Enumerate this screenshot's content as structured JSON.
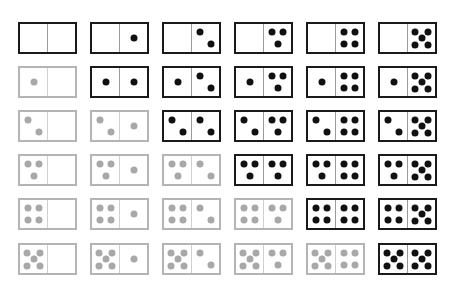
{
  "diagram": {
    "title": "",
    "layout": {
      "columns": 6,
      "rows": 6,
      "col_left": [
        18,
        90,
        162,
        234,
        306,
        378
      ],
      "row_top": [
        22,
        66,
        110,
        154,
        198,
        243
      ],
      "domino_width": 59,
      "domino_height": 32
    },
    "colors": {
      "active_border": "#1a1a1a",
      "active_pip": "#111111",
      "inactive_border": "#b4b4b4",
      "inactive_pip": "#a8a8a8",
      "background": "#ffffff"
    },
    "rows": [
      {
        "dominoes": [
          {
            "left": 0,
            "right": 0,
            "style": "black"
          },
          {
            "left": 0,
            "right": 1,
            "style": "black"
          },
          {
            "left": 0,
            "right": 2,
            "style": "black"
          },
          {
            "left": 0,
            "right": 3,
            "style": "black"
          },
          {
            "left": 0,
            "right": 4,
            "style": "black"
          },
          {
            "left": 0,
            "right": 5,
            "style": "black"
          }
        ]
      },
      {
        "dominoes": [
          {
            "left": 1,
            "right": 0,
            "style": "gray"
          },
          {
            "left": 1,
            "right": 1,
            "style": "black"
          },
          {
            "left": 1,
            "right": 2,
            "style": "black"
          },
          {
            "left": 1,
            "right": 3,
            "style": "black"
          },
          {
            "left": 1,
            "right": 4,
            "style": "black"
          },
          {
            "left": 1,
            "right": 5,
            "style": "black"
          }
        ]
      },
      {
        "dominoes": [
          {
            "left": 2,
            "right": 0,
            "style": "gray"
          },
          {
            "left": 2,
            "right": 1,
            "style": "gray"
          },
          {
            "left": 2,
            "right": 2,
            "style": "black"
          },
          {
            "left": 2,
            "right": 3,
            "style": "black"
          },
          {
            "left": 2,
            "right": 4,
            "style": "black"
          },
          {
            "left": 2,
            "right": 5,
            "style": "black"
          }
        ]
      },
      {
        "dominoes": [
          {
            "left": 3,
            "right": 0,
            "style": "gray"
          },
          {
            "left": 3,
            "right": 1,
            "style": "gray"
          },
          {
            "left": 3,
            "right": 2,
            "style": "gray"
          },
          {
            "left": 3,
            "right": 3,
            "style": "black"
          },
          {
            "left": 3,
            "right": 4,
            "style": "black"
          },
          {
            "left": 3,
            "right": 5,
            "style": "black"
          }
        ]
      },
      {
        "dominoes": [
          {
            "left": 4,
            "right": 0,
            "style": "gray"
          },
          {
            "left": 4,
            "right": 1,
            "style": "gray"
          },
          {
            "left": 4,
            "right": 2,
            "style": "gray"
          },
          {
            "left": 4,
            "right": 3,
            "style": "gray"
          },
          {
            "left": 4,
            "right": 4,
            "style": "black"
          },
          {
            "left": 4,
            "right": 5,
            "style": "black"
          }
        ]
      },
      {
        "dominoes": [
          {
            "left": 5,
            "right": 0,
            "style": "gray"
          },
          {
            "left": 5,
            "right": 1,
            "style": "gray"
          },
          {
            "left": 5,
            "right": 2,
            "style": "gray"
          },
          {
            "left": 5,
            "right": 3,
            "style": "gray"
          },
          {
            "left": 5,
            "right": 4,
            "style": "gray"
          },
          {
            "left": 5,
            "right": 5,
            "style": "black"
          }
        ]
      }
    ],
    "pip_patterns": {
      "0": [],
      "1": [
        [
          0.5,
          0.5
        ]
      ],
      "2": [
        [
          0.3,
          0.3
        ],
        [
          0.7,
          0.72
        ]
      ],
      "3": [
        [
          0.28,
          0.3
        ],
        [
          0.72,
          0.3
        ],
        [
          0.5,
          0.72
        ]
      ],
      "4": [
        [
          0.28,
          0.3
        ],
        [
          0.72,
          0.3
        ],
        [
          0.28,
          0.72
        ],
        [
          0.72,
          0.72
        ]
      ],
      "5": [
        [
          0.26,
          0.27
        ],
        [
          0.74,
          0.27
        ],
        [
          0.5,
          0.5
        ],
        [
          0.26,
          0.75
        ],
        [
          0.74,
          0.75
        ]
      ]
    }
  }
}
